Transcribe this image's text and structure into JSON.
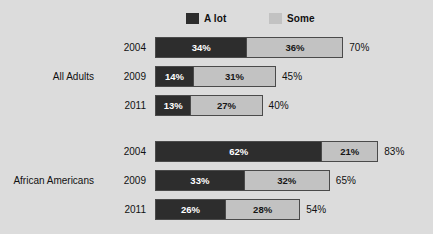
{
  "chart_data": {
    "type": "bar",
    "orientation": "horizontal",
    "stacked": true,
    "title": "",
    "xlabel": "",
    "ylabel": "",
    "xlim": [
      0,
      100
    ],
    "grid": false,
    "legend_position": "top",
    "legend": [
      {
        "name": "A lot",
        "color": "#2d2d2d"
      },
      {
        "name": "Some",
        "color": "#c2c2c2"
      }
    ],
    "series": [
      {
        "name": "A lot",
        "values": [
          34,
          14,
          13,
          62,
          33,
          26
        ]
      },
      {
        "name": "Some",
        "values": [
          36,
          31,
          27,
          21,
          32,
          28
        ]
      }
    ],
    "groups": [
      {
        "label": "All Adults",
        "rows": [
          {
            "year": "2004",
            "a_lot": 34,
            "some": 36,
            "total": 70,
            "a_lot_label": "34%",
            "some_label": "36%",
            "total_label": "70%"
          },
          {
            "year": "2009",
            "a_lot": 14,
            "some": 31,
            "total": 45,
            "a_lot_label": "14%",
            "some_label": "31%",
            "total_label": "45%"
          },
          {
            "year": "2011",
            "a_lot": 13,
            "some": 27,
            "total": 40,
            "a_lot_label": "13%",
            "some_label": "27%",
            "total_label": "40%"
          }
        ]
      },
      {
        "label": "African Americans",
        "rows": [
          {
            "year": "2004",
            "a_lot": 62,
            "some": 21,
            "total": 83,
            "a_lot_label": "62%",
            "some_label": "21%",
            "total_label": "83%"
          },
          {
            "year": "2009",
            "a_lot": 33,
            "some": 32,
            "total": 65,
            "a_lot_label": "33%",
            "some_label": "32%",
            "total_label": "65%"
          },
          {
            "year": "2011",
            "a_lot": 26,
            "some": 28,
            "total": 54,
            "a_lot_label": "26%",
            "some_label": "28%",
            "total_label": "54%"
          }
        ]
      }
    ],
    "categories": [
      "All Adults 2004",
      "All Adults 2009",
      "All Adults 2011",
      "African Americans 2004",
      "African Americans 2009",
      "African Americans 2011"
    ]
  },
  "colors": {
    "background": "#dcdcdc",
    "a_lot": "#2d2d2d",
    "some": "#c2c2c2",
    "bar_border": "#4a4a4a",
    "text": "#111111"
  }
}
